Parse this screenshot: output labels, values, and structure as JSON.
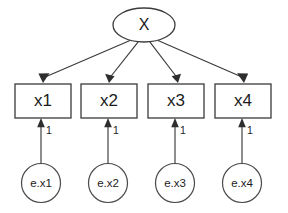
{
  "diagram": {
    "type": "sem-path-diagram",
    "title": "",
    "background_color": "#ffffff",
    "line_color": "#3a3a3a",
    "text_color": "#1c1c1c",
    "latent": {
      "id": "X",
      "label": "X",
      "shape": "ellipse",
      "cx": 144,
      "cy": 25,
      "rx": 31,
      "ry": 17
    },
    "indicators": [
      {
        "id": "x1",
        "label": "x1",
        "shape": "rect",
        "x": 15,
        "y": 84,
        "w": 56,
        "h": 34,
        "cx": 43
      },
      {
        "id": "x2",
        "label": "x2",
        "shape": "rect",
        "x": 81,
        "y": 84,
        "w": 56,
        "h": 34,
        "cx": 109
      },
      {
        "id": "x3",
        "label": "x3",
        "shape": "rect",
        "x": 148,
        "y": 84,
        "w": 56,
        "h": 34,
        "cx": 176
      },
      {
        "id": "x4",
        "label": "x4",
        "shape": "rect",
        "x": 215,
        "y": 84,
        "w": 56,
        "h": 34,
        "cx": 243
      }
    ],
    "errors": [
      {
        "id": "e.x1",
        "label": "e.x1",
        "shape": "circle",
        "cx": 41,
        "cy": 183,
        "r": 19.5
      },
      {
        "id": "e.x2",
        "label": "e.x2",
        "shape": "circle",
        "cx": 108,
        "cy": 183,
        "r": 19.5
      },
      {
        "id": "e.x3",
        "label": "e.x3",
        "shape": "circle",
        "cx": 175,
        "cy": 183,
        "r": 19.5
      },
      {
        "id": "e.x4",
        "label": "e.x4",
        "shape": "circle",
        "cx": 242,
        "cy": 183,
        "r": 19.5
      }
    ],
    "loading_paths": [
      {
        "from": "X",
        "to": "x1",
        "label": ""
      },
      {
        "from": "X",
        "to": "x2",
        "label": ""
      },
      {
        "from": "X",
        "to": "x3",
        "label": ""
      },
      {
        "from": "X",
        "to": "x4",
        "label": ""
      }
    ],
    "error_paths": [
      {
        "from": "e.x1",
        "to": "x1",
        "label": "1",
        "label_x": 46,
        "label_y": 131
      },
      {
        "from": "e.x2",
        "to": "x2",
        "label": "1",
        "label_x": 113,
        "label_y": 131
      },
      {
        "from": "e.x3",
        "to": "x3",
        "label": "1",
        "label_x": 180,
        "label_y": 131
      },
      {
        "from": "e.x4",
        "to": "x4",
        "label": "1",
        "label_x": 247,
        "label_y": 131
      }
    ]
  }
}
